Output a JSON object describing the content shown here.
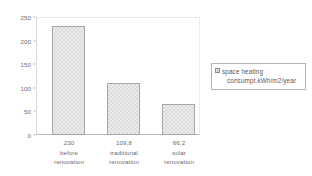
{
  "chart_data": {
    "type": "bar",
    "title": "",
    "xlabel": "",
    "ylabel": "",
    "categories": [
      "before renovation",
      "traditional renovation",
      "solar renovation"
    ],
    "category_lines": [
      [
        "before",
        "renovation"
      ],
      [
        "traditional",
        "renovation"
      ],
      [
        "solar",
        "renovation"
      ]
    ],
    "value_labels": [
      "230",
      "109,8",
      "66,2"
    ],
    "values": [
      230,
      109.8,
      66.2
    ],
    "ylim": [
      0,
      250
    ],
    "yticks": [
      0,
      50,
      100,
      150,
      200,
      250
    ],
    "ytick_labels": [
      "0",
      "50",
      "100",
      "150",
      "200",
      "250"
    ],
    "grid": false,
    "legend_position": "right",
    "series": [
      {
        "name": "space heating consumpt.kWh/m2/year",
        "values": [
          230,
          109.8,
          66.2
        ]
      }
    ]
  },
  "legend": {
    "line1": "space heating",
    "line2": "consumpt.kWh/m2/year",
    "swatch_name": "pattern-swatch-icon"
  },
  "colors": {
    "bar_fill": "#ebebeb",
    "bar_pattern": "#dcdcdc",
    "bar_border": "#a6a6a6",
    "axis_text": "#6e6e6e",
    "frame": "#bdbdbd",
    "background": "#ffffff"
  }
}
